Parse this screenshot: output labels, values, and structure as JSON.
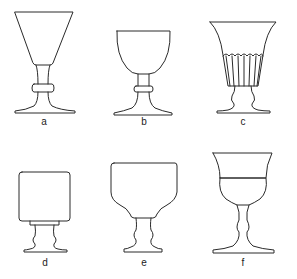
{
  "figure": {
    "glasses": [
      {
        "id": "a",
        "label": "a",
        "form": "conical bowl, knopped stem, wide foot"
      },
      {
        "id": "b",
        "label": "b",
        "form": "rounded bucket bowl, knopped stem, wide foot"
      },
      {
        "id": "c",
        "label": "c",
        "form": "flared trumpet bowl with fluted base, short stem"
      },
      {
        "id": "d",
        "label": "d",
        "form": "straight-sided cylindrical bowl, double-baluster stem"
      },
      {
        "id": "e",
        "label": "e",
        "form": "shouldered bowl, double-baluster stem"
      },
      {
        "id": "f",
        "label": "f",
        "form": "flared rim over cup bowl, double-baluster stem"
      }
    ]
  }
}
